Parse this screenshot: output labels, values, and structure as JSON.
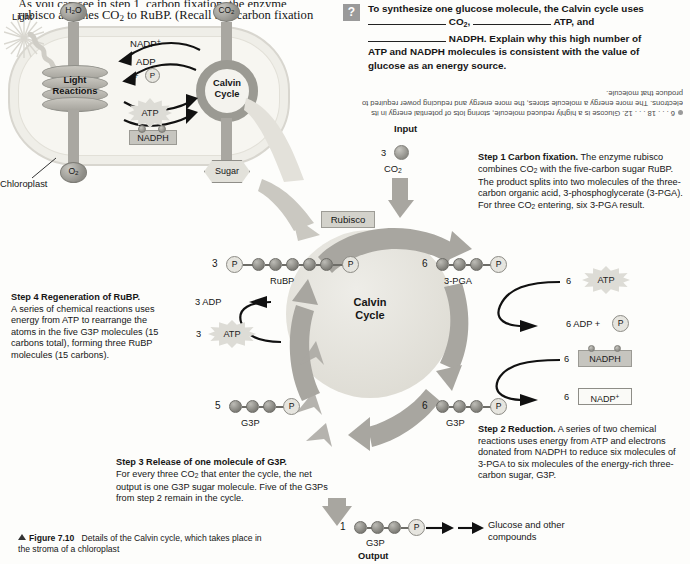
{
  "running_text": {
    "line1": "As you can see in step 1, carbon fixation, the enzyme",
    "line2": "rubisco attaches CO₂ to RuBP. (Recall that carbon fixation"
  },
  "question_box": {
    "marker": "?",
    "line1_a": "To synthesize one glucose molecule, the Calvin cycle uses",
    "blank1_after": "CO₂,",
    "blank2_after": "ATP, and",
    "blank3_after": "NADPH. Explain why this high number of",
    "line4": "ATP and NADPH molecules is consistent with the value of",
    "line5": "glucose as an energy source.",
    "answer": "6 . . . 18 . . . 12. Glucose is a highly reduced molecule, storing lots of potential energy in its electrons. The more energy a molecule stores, the more energy and reducing power required to produce that molecule."
  },
  "overview": {
    "light_label": "Light",
    "h2o_label": "H₂O",
    "co2_label": "CO₂",
    "light_reactions_l1": "Light",
    "light_reactions_l2": "Reactions",
    "calvin_l1": "Calvin",
    "calvin_l2": "Cycle",
    "nadp_plus": "NADP",
    "nadp_plus_sup": "+",
    "adp": "ADP",
    "plus": "+",
    "p": "P",
    "atp": "ATP",
    "nadph": "NADPH",
    "chloroplast_label": "Chloroplast",
    "o2_label": "O₂",
    "sugar_label": "Sugar"
  },
  "cycle": {
    "center_l1": "Calvin",
    "center_l2": "Cycle",
    "input_label": "Input",
    "input_count": "3",
    "input_name": "CO₂",
    "rubisco": "Rubisco",
    "rubp_count": "3",
    "rubp_name": "RuBP",
    "pga_count": "6",
    "pga_name": "3-PGA",
    "atp_count": "6",
    "atp_label": "ATP",
    "adp_result": "6 ADP +",
    "adp_p": "P",
    "nadph_count": "6",
    "nadph_label": "NADPH",
    "nadp_count": "6",
    "nadp_label": "NADP",
    "nadp_sup": "+",
    "g3p_left_count": "5",
    "g3p_left_name": "G3P",
    "g3p_right_count": "6",
    "g3p_right_name": "G3P",
    "adp_regen": "3 ADP",
    "atp_regen_count": "3",
    "atp_regen_label": "ATP",
    "output_count": "1",
    "output_name": "G3P",
    "output_label": "Output",
    "product_l1": "Glucose and other",
    "product_l2": "compounds",
    "p_glyph": "P"
  },
  "steps": {
    "step1_title": "Step 1 Carbon fixation.",
    "step1_body": " The enzyme rubisco combines CO₂ with the five-carbon sugar RuBP. The product splits into two molecules of the three-carbon organic acid, 3-phosphoglycerate (3-PGA). For three CO₂ entering, six 3-PGA result.",
    "step2_title": "Step 2 Reduction.",
    "step2_body": " A series of two chemical reactions uses energy from ATP and electrons donated from NADPH to reduce six molecules of 3-PGA to six molecules of the energy-rich three-carbon sugar, G3P.",
    "step3_title": "Step 3 Release of one molecule of G3P.",
    "step3_body": "For every three CO₂ that enter the cycle, the net output is one G3P sugar molecule. Five of the G3Ps from step 2 remain in the cycle.",
    "step4_title": "Step 4 Regeneration of RuBP.",
    "step4_body": "A series of chemical reactions uses energy from ATP to rearrange the atoms in the five G3P molecules (15 carbons total), forming three RuBP molecules (15 carbons)."
  },
  "caption": {
    "figure_number": "Figure 7.10",
    "text": "Details of the Calvin cycle, which takes place in the stroma of a chloroplast"
  },
  "colors": {
    "gray_arrow": "#a9a7a1",
    "ring": "#9b9a93",
    "question_marker": "#9a9a9a",
    "carbon": "#8d8c86",
    "cycle_fill": "#e3e1d9"
  }
}
